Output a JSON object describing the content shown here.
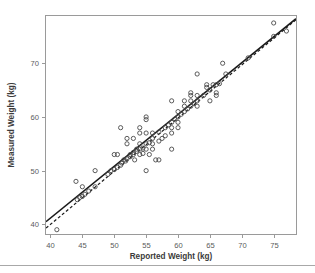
{
  "chart_data": {
    "type": "scatter",
    "title": "",
    "xlabel": "Reported Weight (kg)",
    "ylabel": "Measured Weight (kg)",
    "xlim": [
      39.3,
      78.5
    ],
    "ylim": [
      38.2,
      78.8
    ],
    "xticks": [
      40,
      45,
      50,
      55,
      60,
      65,
      70,
      75
    ],
    "xtick_labels": [
      "40",
      "45",
      "50",
      "55",
      "60",
      "65",
      "70",
      "75"
    ],
    "yticks": [
      40,
      50,
      60,
      70
    ],
    "ytick_labels": [
      "40",
      "50",
      "60",
      "70"
    ],
    "grid": false,
    "legend": "none",
    "marker": "open-circle",
    "marker_color": "#4a4a4a",
    "line_color": "#1a1a1a",
    "points": [
      [
        41.0,
        39.0
      ],
      [
        44.0,
        48.0
      ],
      [
        44.2,
        44.6
      ],
      [
        44.6,
        45.0
      ],
      [
        45.0,
        47.0
      ],
      [
        45.0,
        45.2
      ],
      [
        45.4,
        45.6
      ],
      [
        46.0,
        46.2
      ],
      [
        47.0,
        47.0
      ],
      [
        47.0,
        50.0
      ],
      [
        49.0,
        49.3
      ],
      [
        49.5,
        50.0
      ],
      [
        50.0,
        50.2
      ],
      [
        50.0,
        53.0
      ],
      [
        50.5,
        53.0
      ],
      [
        50.5,
        50.6
      ],
      [
        51.0,
        58.0
      ],
      [
        51.0,
        51.0
      ],
      [
        51.2,
        51.4
      ],
      [
        51.5,
        52.0
      ],
      [
        51.8,
        51.8
      ],
      [
        52.0,
        52.2
      ],
      [
        52.0,
        55.0
      ],
      [
        52.0,
        56.0
      ],
      [
        52.5,
        52.6
      ],
      [
        52.5,
        53.0
      ],
      [
        53.0,
        53.0
      ],
      [
        53.0,
        53.4
      ],
      [
        53.0,
        56.0
      ],
      [
        53.2,
        52.0
      ],
      [
        53.5,
        53.6
      ],
      [
        53.5,
        54.0
      ],
      [
        54.0,
        54.0
      ],
      [
        54.0,
        53.0
      ],
      [
        54.0,
        55.0
      ],
      [
        54.0,
        58.0
      ],
      [
        54.0,
        57.0
      ],
      [
        54.5,
        54.2
      ],
      [
        54.5,
        53.2
      ],
      [
        55.0,
        55.0
      ],
      [
        55.0,
        60.0
      ],
      [
        55.0,
        59.5
      ],
      [
        55.0,
        57.0
      ],
      [
        55.0,
        54.0
      ],
      [
        55.0,
        50.0
      ],
      [
        55.5,
        55.2
      ],
      [
        55.5,
        53.0
      ],
      [
        56.0,
        56.0
      ],
      [
        56.0,
        57.0
      ],
      [
        56.0,
        55.0
      ],
      [
        56.0,
        54.0
      ],
      [
        56.5,
        52.0
      ],
      [
        57.0,
        57.2
      ],
      [
        57.0,
        55.5
      ],
      [
        57.0,
        52.0
      ],
      [
        57.5,
        56.0
      ],
      [
        58.0,
        58.0
      ],
      [
        58.0,
        56.5
      ],
      [
        58.5,
        58.5
      ],
      [
        59.0,
        63.0
      ],
      [
        59.0,
        59.0
      ],
      [
        59.0,
        58.0
      ],
      [
        59.0,
        57.0
      ],
      [
        59.0,
        54.0
      ],
      [
        59.5,
        59.6
      ],
      [
        60.0,
        60.0
      ],
      [
        60.0,
        59.0
      ],
      [
        60.0,
        58.0
      ],
      [
        60.0,
        61.0
      ],
      [
        60.5,
        60.5
      ],
      [
        61.0,
        61.0
      ],
      [
        61.0,
        62.0
      ],
      [
        61.0,
        63.0
      ],
      [
        61.5,
        61.5
      ],
      [
        62.0,
        62.0
      ],
      [
        62.0,
        64.0
      ],
      [
        62.0,
        64.5
      ],
      [
        62.0,
        63.0
      ],
      [
        62.5,
        62.5
      ],
      [
        63.0,
        68.0
      ],
      [
        63.0,
        64.0
      ],
      [
        63.0,
        63.0
      ],
      [
        63.0,
        62.0
      ],
      [
        64.0,
        64.0
      ],
      [
        64.5,
        66.0
      ],
      [
        64.5,
        65.5
      ],
      [
        65.0,
        65.0
      ],
      [
        65.0,
        63.0
      ],
      [
        65.5,
        66.0
      ],
      [
        66.0,
        66.0
      ],
      [
        66.0,
        64.0
      ],
      [
        66.0,
        64.5
      ],
      [
        66.5,
        66.2
      ],
      [
        67.0,
        70.0
      ],
      [
        67.5,
        68.0
      ],
      [
        71.0,
        71.0
      ],
      [
        75.0,
        77.5
      ],
      [
        75.0,
        75.0
      ],
      [
        77.0,
        76.0
      ]
    ],
    "lines": [
      {
        "name": "identity-line",
        "style": "solid",
        "x0": 39.3,
        "y0": 40.5,
        "x1": 78.5,
        "y1": 78.3
      },
      {
        "name": "regression-line",
        "style": "dashed",
        "x0": 39.3,
        "y0": 39.3,
        "x1": 78.5,
        "y1": 78.1
      }
    ]
  },
  "figure": {
    "background": "#ffffff",
    "frame_color": "#9a9a9a",
    "rule_color": "#a8a8a8"
  }
}
